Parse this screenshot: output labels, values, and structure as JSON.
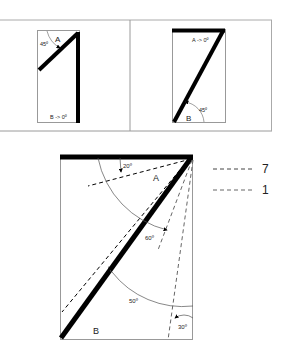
{
  "top_left_panel": {
    "label_a": "A",
    "label_angle": "45º",
    "label_b": "B -> 0º"
  },
  "top_right_panel": {
    "label_a": "A -> 0º",
    "label_angle": "45º",
    "label_b": "B"
  },
  "bottom_panel": {
    "label_a": "A",
    "label_b": "B",
    "angle_20": "20º",
    "angle_60": "60º",
    "angle_50": "50º",
    "angle_30": "30º"
  },
  "legend": {
    "items": [
      {
        "label": "7"
      },
      {
        "label": "1"
      }
    ]
  },
  "colors": {
    "stroke": "#000000",
    "frame": "#9a9a9a",
    "text": "#222222"
  }
}
